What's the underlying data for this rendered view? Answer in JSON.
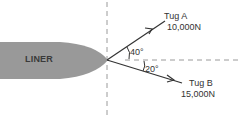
{
  "diagram": {
    "liner_label": "LINER",
    "tug_a": {
      "name": "Tug A",
      "force": "10,000N",
      "angle": "40°"
    },
    "tug_b": {
      "name": "Tug B",
      "force": "15,000N",
      "angle": "20°"
    },
    "colors": {
      "liner_fill": "#999999",
      "line": "#333333",
      "dashed": "#9a9a9a"
    }
  }
}
